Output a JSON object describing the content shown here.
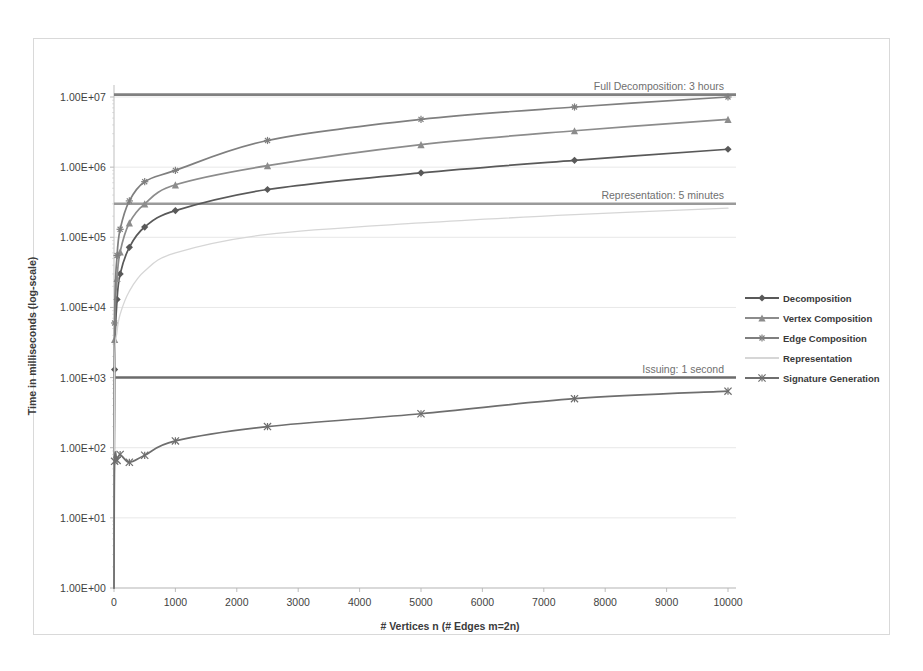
{
  "chart_data": {
    "type": "line",
    "title": "",
    "xlabel": "# Vertices n (# Edges m=2n)",
    "ylabel": "Time in milliseconds  (log-scale)",
    "xlim": [
      0,
      10000
    ],
    "ylim": [
      1,
      10000000
    ],
    "yscale": "log",
    "grid": true,
    "legend_position": "right",
    "xticks": [
      0,
      1000,
      2000,
      3000,
      4000,
      5000,
      6000,
      7000,
      8000,
      9000,
      10000
    ],
    "xtick_labels": [
      "0",
      "1000",
      "2000",
      "3000",
      "4000",
      "5000",
      "6000",
      "7000",
      "8000",
      "9000",
      "10000"
    ],
    "yticks": [
      1,
      10,
      100,
      1000,
      10000,
      100000,
      1000000,
      10000000
    ],
    "ytick_labels": [
      "1.00E+00",
      "1.00E+01",
      "1.00E+02",
      "1.00E+03",
      "1.00E+04",
      "1.00E+05",
      "1.00E+06",
      "1.00E+07"
    ],
    "series": [
      {
        "name": "Decomposition",
        "color": "#595959",
        "marker": "diamond",
        "x": [
          10,
          50,
          100,
          250,
          500,
          1000,
          2500,
          5000,
          7500,
          10000
        ],
        "values": [
          1300,
          13000,
          30000,
          72000,
          140000,
          240000,
          480000,
          830000,
          1250000,
          1800000
        ]
      },
      {
        "name": "Vertex Composition",
        "color": "#8c8c8c",
        "marker": "triangle",
        "x": [
          10,
          50,
          100,
          250,
          500,
          1000,
          2500,
          5000,
          7500,
          10000
        ],
        "values": [
          3500,
          26000,
          62000,
          160000,
          300000,
          560000,
          1050000,
          2100000,
          3300000,
          4800000
        ]
      },
      {
        "name": "Edge Composition",
        "color": "#7f7f7f",
        "marker": "asterisk",
        "x": [
          10,
          50,
          100,
          250,
          500,
          1000,
          2500,
          5000,
          7500,
          10000
        ],
        "values": [
          6000,
          55000,
          130000,
          330000,
          620000,
          900000,
          2400000,
          4800000,
          7200000,
          10000000
        ]
      },
      {
        "name": "Representation",
        "color": "#d6d6d6",
        "marker": "none",
        "x": [
          10,
          50,
          100,
          250,
          500,
          1000,
          2500,
          5000,
          7500,
          10000
        ],
        "values": [
          1200,
          4500,
          8000,
          17000,
          33000,
          60000,
          110000,
          160000,
          210000,
          260000
        ]
      },
      {
        "name": "Signature Generation",
        "color": "#6e6e6e",
        "marker": "x",
        "x": [
          10,
          50,
          100,
          250,
          500,
          1000,
          2500,
          5000,
          7500,
          10000
        ],
        "values": [
          64,
          66,
          80,
          62,
          78,
          125,
          200,
          305,
          500,
          640
        ]
      }
    ],
    "annotations": [
      {
        "text": "Full Decomposition: 3 hours",
        "value": 10800000,
        "color": "#808080"
      },
      {
        "text": "Representation: 5 minutes",
        "value": 300000,
        "color": "#9a9a9a"
      },
      {
        "text": "Issuing: 1 second",
        "value": 1000,
        "color": "#6b6b6b"
      }
    ]
  }
}
